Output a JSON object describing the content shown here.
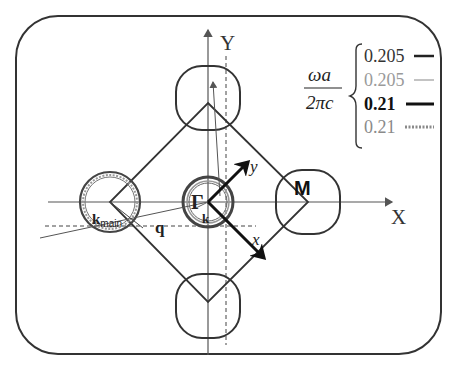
{
  "diagram": {
    "axes": {
      "x_label": "X",
      "y_label": "Y"
    },
    "rotated_axes": {
      "x_label": "x",
      "y_label": "y"
    },
    "points": {
      "gamma": "Γ",
      "m": "M"
    },
    "vectors": {
      "k": "k",
      "k_main": "k",
      "k_main_sub": "main",
      "q": "q"
    },
    "legend": {
      "quantity_numerator": "ωa",
      "quantity_denominator": "2πc",
      "entries": [
        {
          "value": "0.205",
          "style": "solid-thick",
          "color": "#333333"
        },
        {
          "value": "0.205",
          "style": "solid-thin",
          "color": "#9a9a9a"
        },
        {
          "value": "0.21",
          "style": "solid-bold",
          "color": "#111111"
        },
        {
          "value": "0.21",
          "style": "dotted",
          "color": "#8a8a8a"
        }
      ]
    },
    "colors": {
      "stroke": "#333333",
      "light": "#9a9a9a",
      "background": "#ffffff"
    }
  }
}
